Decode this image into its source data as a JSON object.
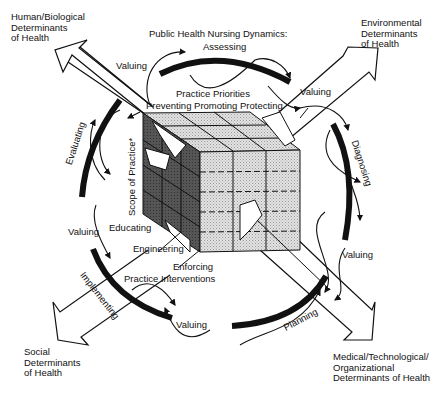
{
  "title": "Public Health Nursing Dynamics:",
  "determinants": {
    "top_left": [
      "Human/Biological",
      "Determinants",
      "of Health"
    ],
    "top_right": [
      "Environmental",
      "Determinants",
      "of Health"
    ],
    "bottom_left": [
      "Social",
      "Determinants",
      "of Health"
    ],
    "bottom_right": [
      "Medical/Technological/",
      "Organizational",
      "Determinants of Health"
    ]
  },
  "dynamics": {
    "assessing": "Assessing",
    "diagnosing": "Diagnosing",
    "planning": "Planning",
    "implementing": "Implementing",
    "evaluating": "Evaluating",
    "valuing": "Valuing"
  },
  "cube": {
    "practice_priorities": "Practice Priorities",
    "priorities_row": "Preventing Promoting Protecting",
    "scope": "Scope of Practice*",
    "interventions": [
      "Educating",
      "Engineering",
      "Enforcing"
    ],
    "practice_interventions": "Practice Interventions"
  },
  "colors": {
    "ink": "#111111",
    "cube_top": "#c8c8c8",
    "cube_left": "#4a4a4a",
    "cube_front": "#d6d6d6",
    "background": "#ffffff"
  }
}
